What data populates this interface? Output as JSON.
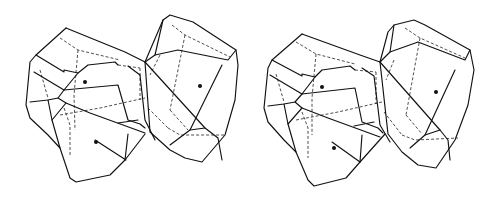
{
  "figure": {
    "type": "stereo-pair",
    "colors": {
      "background": "#ffffff",
      "line": "#111111"
    },
    "views": [
      {
        "id": "left-view",
        "solid": [
          "M66,28 L125,52 L145,62",
          "M66,28 L36,55 L30,62 L26,105 L30,118 L48,135 L60,148 L70,178 L76,182 L110,175 L125,160 L128,134",
          "M36,55 L64,72 L64,70 L78,73 L88,65 L115,62 L118,65",
          "M78,73 L64,90 L58,98 L48,100 L30,102",
          "M34,72 L64,90",
          "M64,90 L118,85 L128,120 L140,124 L145,128",
          "M58,98 L66,103 L90,113 L145,133",
          "M48,100 L52,120 L60,148",
          "M52,120 L66,103",
          "M95,140 L126,160",
          "M118,123 L138,120",
          "M125,160 L145,134",
          "M145,62 L163,20 L170,15 L193,22 L236,50 L238,65 L235,100 L225,135 L202,162 L185,158 L170,150 L150,132 L145,62",
          "M145,62 L155,55 L178,50 L228,60 L236,50",
          "M155,55 L163,20",
          "M128,66 L140,75 L145,120 L155,140",
          "M145,62 L205,128 L218,138 L222,160",
          "M222,65 L190,130 L170,145",
          "M190,130 L205,128"
        ],
        "dashed": [
          "M60,38 L78,50 L120,60",
          "M78,50 L74,95 L75,130",
          "M40,70 L48,98",
          "M64,108 L70,125 L70,155",
          "M60,115 L100,108 L145,98",
          "M118,65 L140,68",
          "M140,68 L140,100",
          "M172,25 L185,35 L230,57",
          "M185,35 L170,110",
          "M160,55 L150,75",
          "M168,128 L180,135 L225,135",
          "M170,110 L188,130",
          "M148,108 L168,128"
        ],
        "dots": [
          {
            "cx": 85,
            "cy": 82
          },
          {
            "cx": 96,
            "cy": 142
          },
          {
            "cx": 200,
            "cy": 86
          }
        ]
      },
      {
        "id": "right-view",
        "solid": [
          "M52,34 L110,55 L130,62",
          "M52,34 L22,60 L18,68 L14,108 L18,122 L34,140 L46,152 L58,180 L64,186 L96,178 L110,162 L112,135",
          "M22,60 L52,76 L52,74 L65,77 L72,70 L100,66 L105,70",
          "M65,77 L52,94 L45,102 L34,104 L18,106",
          "M20,75 L52,94",
          "M52,94 L105,88 L112,122 L128,128 L133,133",
          "M45,102 L52,108 L78,118 L130,137",
          "M34,104 L38,124 L46,152",
          "M38,124 L52,108",
          "M82,142 L110,162",
          "M104,126 L124,122",
          "M110,162 L135,134",
          "M130,62 L138,32 L144,25 L164,20 L175,25 L220,50 L224,70 L218,105 L205,140 L186,168 L168,165 L152,152 L138,134 L130,62",
          "M130,62 L140,52 L168,42 L215,60 L220,50",
          "M140,52 L144,25",
          "M112,68 L124,76 L130,125 L140,142",
          "M130,62 L190,130 L198,140 L200,160",
          "M205,70 L175,135 L160,148",
          "M175,135 L190,130"
        ],
        "dashed": [
          "M46,42 L66,54 L105,64",
          "M66,54 L62,98 L62,135",
          "M26,74 L34,102",
          "M52,112 L58,128 L58,158",
          "M46,120 L88,112 L132,102",
          "M105,70 L126,72",
          "M126,72 L126,104",
          "M155,28 L170,38 L215,58",
          "M170,38 L156,115",
          "M144,60 L136,80",
          "M152,135 L165,140 L208,138",
          "M156,115 L172,134",
          "M134,112 L152,135"
        ],
        "dots": [
          {
            "cx": 72,
            "cy": 87
          },
          {
            "cx": 84,
            "cy": 148
          },
          {
            "cx": 186,
            "cy": 92
          }
        ]
      }
    ]
  }
}
